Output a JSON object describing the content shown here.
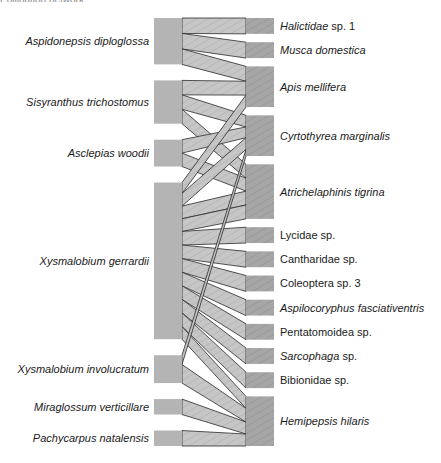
{
  "header": {
    "clipped_text": "Pollination network"
  },
  "colors": {
    "plant_box": "#b4b4b4",
    "pollinator_box": "#a8a8a8",
    "link_fill": "#c8c8c8",
    "link_stroke": "#2a2a2a",
    "label": "#1a1a1a"
  },
  "chart_data": {
    "type": "bipartite-network",
    "title": "",
    "left_level": "plants",
    "right_level": "pollinators",
    "plants": [
      {
        "name": "Aspidonepsis diploglossa",
        "italic": true,
        "weight": 45
      },
      {
        "name": "Sisyranthus trichostomus",
        "italic": true,
        "weight": 42
      },
      {
        "name": "Asclepias woodii",
        "italic": true,
        "weight": 26
      },
      {
        "name": "Xysmalobium gerrardii",
        "italic": true,
        "weight": 152
      },
      {
        "name": "Xysmalobium involucratum",
        "italic": true,
        "weight": 27
      },
      {
        "name": "Miraglossum verticillare",
        "italic": true,
        "weight": 15
      },
      {
        "name": "Pachycarpus natalensis",
        "italic": true,
        "weight": 15
      }
    ],
    "pollinators": [
      {
        "name": "Halictidae sp. 1",
        "italic_part": "Halictidae",
        "rest": " sp. 1",
        "weight": 16
      },
      {
        "name": "Musca domestica",
        "italic_part": "Musca domestica",
        "rest": "",
        "weight": 16
      },
      {
        "name": "Apis mellifera",
        "italic_part": "Apis mellifera",
        "rest": "",
        "weight": 41
      },
      {
        "name": "Cyrtothyrea marginalis",
        "italic_part": "Cyrtothyrea marginalis",
        "rest": "",
        "weight": 41
      },
      {
        "name": "Atrichelaphinis tigrina",
        "italic_part": "Atrichelaphinis tigrina",
        "rest": "",
        "weight": 55
      },
      {
        "name": "Lycidae sp.",
        "italic_part": "",
        "rest": "Lycidae sp.",
        "weight": 16
      },
      {
        "name": "Cantharidae sp.",
        "italic_part": "",
        "rest": "Cantharidae sp.",
        "weight": 16
      },
      {
        "name": "Coleoptera sp. 3",
        "italic_part": "",
        "rest": "Coleoptera sp. 3",
        "weight": 16
      },
      {
        "name": "Aspilocoryphus fasciativentris",
        "italic_part": "Aspilocoryphus fasciativentris",
        "rest": "",
        "weight": 16
      },
      {
        "name": "Pentatomoidea sp.",
        "italic_part": "",
        "rest": "Pentatomoidea sp.",
        "weight": 16
      },
      {
        "name": "Sarcophaga sp.",
        "italic_part": "Sarcophaga",
        "rest": " sp.",
        "weight": 16
      },
      {
        "name": "Bibionidae sp.",
        "italic_part": "",
        "rest": "Bibionidae sp.",
        "weight": 16
      },
      {
        "name": "Hemipepsis hilaris",
        "italic_part": "Hemipepsis hilaris",
        "rest": "",
        "weight": 50
      }
    ],
    "links": [
      {
        "plant": 0,
        "pollinator": 0,
        "weight": 15
      },
      {
        "plant": 0,
        "pollinator": 1,
        "weight": 15
      },
      {
        "plant": 0,
        "pollinator": 2,
        "weight": 15
      },
      {
        "plant": 1,
        "pollinator": 2,
        "weight": 14
      },
      {
        "plant": 1,
        "pollinator": 3,
        "weight": 14
      },
      {
        "plant": 1,
        "pollinator": 4,
        "weight": 14
      },
      {
        "plant": 2,
        "pollinator": 3,
        "weight": 13
      },
      {
        "plant": 2,
        "pollinator": 4,
        "weight": 13
      },
      {
        "plant": 3,
        "pollinator": 2,
        "weight": 12
      },
      {
        "plant": 3,
        "pollinator": 3,
        "weight": 14
      },
      {
        "plant": 3,
        "pollinator": 4,
        "weight": 14
      },
      {
        "plant": 3,
        "pollinator": 4,
        "weight": 14
      },
      {
        "plant": 3,
        "pollinator": 5,
        "weight": 15
      },
      {
        "plant": 3,
        "pollinator": 6,
        "weight": 15
      },
      {
        "plant": 3,
        "pollinator": 7,
        "weight": 15
      },
      {
        "plant": 3,
        "pollinator": 8,
        "weight": 15
      },
      {
        "plant": 3,
        "pollinator": 9,
        "weight": 15
      },
      {
        "plant": 3,
        "pollinator": 10,
        "weight": 15
      },
      {
        "plant": 3,
        "pollinator": 11,
        "weight": 15
      },
      {
        "plant": 3,
        "pollinator": 12,
        "weight": 14
      },
      {
        "plant": 4,
        "pollinator": 3,
        "weight": 8
      },
      {
        "plant": 4,
        "pollinator": 12,
        "weight": 16
      },
      {
        "plant": 5,
        "pollinator": 12,
        "weight": 14
      },
      {
        "plant": 6,
        "pollinator": 12,
        "weight": 14
      }
    ]
  }
}
